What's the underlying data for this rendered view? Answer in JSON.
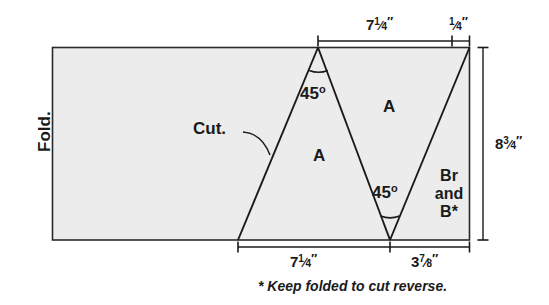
{
  "diagram": {
    "fill_color": "#ececec",
    "line_color": "#1a1a1a",
    "labels": {
      "fold": "Fold.",
      "cut": "Cut.",
      "region_a_upper": "A",
      "region_a_lower": "A",
      "region_br_line1": "Br",
      "region_br_line2": "and",
      "region_br_line3": "B*",
      "angle_top": "45",
      "angle_top_unit": "o",
      "angle_bottom": "45",
      "angle_bottom_unit": "o"
    },
    "dimensions": {
      "top_main": {
        "whole": "7",
        "numerator": "1",
        "denominator": "4",
        "unit": "″",
        "text": "7¼″"
      },
      "top_small": {
        "whole": "",
        "numerator": "1",
        "denominator": "4",
        "unit": "″",
        "text": "¼″"
      },
      "right_height": {
        "whole": "8",
        "numerator": "3",
        "denominator": "4",
        "unit": "″",
        "text": "8¾″"
      },
      "bottom_left": {
        "whole": "7",
        "numerator": "1",
        "denominator": "4",
        "unit": "″",
        "text": "7¼″"
      },
      "bottom_right": {
        "whole": "3",
        "numerator": "7",
        "denominator": "8",
        "unit": "″",
        "text": "3⅞″"
      }
    },
    "footnote": "* Keep folded to cut reverse."
  }
}
